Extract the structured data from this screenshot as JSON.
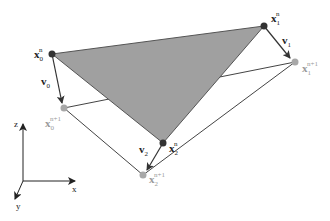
{
  "diagram": {
    "colors": {
      "triangle_fill": "#a0a0a0",
      "triangle_edge": "#555555",
      "current_node": "#333333",
      "next_node": "#a8a8a8",
      "next_label": "#9a9a9a",
      "line": "#444444",
      "background": "#ffffff"
    },
    "nodes_current": [
      {
        "id": "x0n",
        "base": "x",
        "sub": "0",
        "sup": "n"
      },
      {
        "id": "x1n",
        "base": "x",
        "sub": "1",
        "sup": "n"
      },
      {
        "id": "x2n",
        "base": "x",
        "sub": "2",
        "sup": "n"
      }
    ],
    "nodes_next": [
      {
        "id": "x0n1",
        "base": "x",
        "sub": "0",
        "sup": "n+1"
      },
      {
        "id": "x1n1",
        "base": "x",
        "sub": "1",
        "sup": "n+1"
      },
      {
        "id": "x2n1",
        "base": "x",
        "sub": "2",
        "sup": "n+1"
      }
    ],
    "velocities": [
      {
        "id": "v0",
        "base": "v",
        "sub": "0"
      },
      {
        "id": "v1",
        "base": "v",
        "sub": "1"
      },
      {
        "id": "v2",
        "base": "v",
        "sub": "2"
      }
    ],
    "axes": {
      "z": "z",
      "x": "x",
      "y": "y"
    }
  }
}
